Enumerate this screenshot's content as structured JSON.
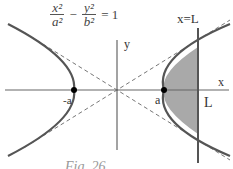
{
  "equation": {
    "term1_num": "x²",
    "term1_den": "a²",
    "minus": "−",
    "term2_num": "y²",
    "term2_den": "b²",
    "equals": "= 1"
  },
  "labels": {
    "line_label": "x=L",
    "x_axis": "x",
    "y_axis": "y",
    "neg_vertex": "-a",
    "pos_vertex": "a",
    "L_mark": "L",
    "caption": "Fig. 26"
  },
  "colors": {
    "curve": "#555555",
    "axis": "#666666",
    "asymptote": "#777777",
    "shade": "#a9a9a9",
    "point": "#000000"
  },
  "geometry": {
    "origin": [
      117,
      90
    ],
    "a": 45,
    "b": 28,
    "L_x": 198
  }
}
